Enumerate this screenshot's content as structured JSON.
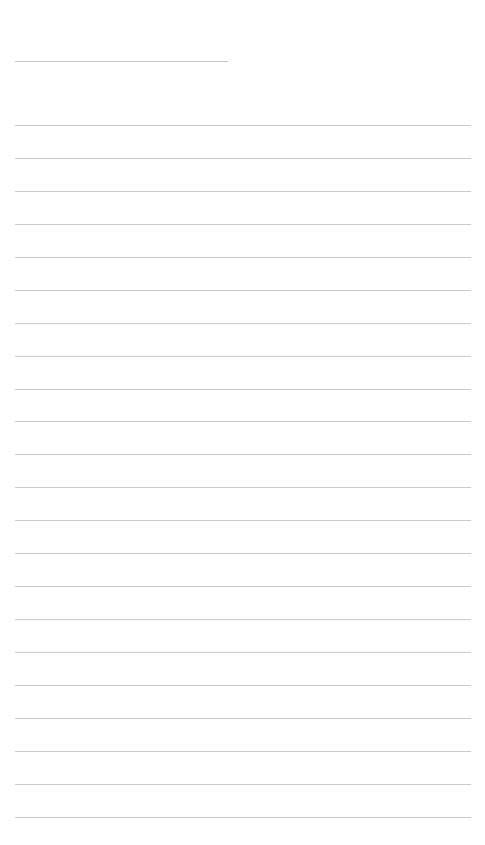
{
  "document": {
    "kind": "ruled-note-page",
    "title_text": "",
    "body_text": "",
    "page_width": 485,
    "page_height": 845,
    "background_color": "#ffffff",
    "rule_color": "#c9cacc",
    "title_rule_color": "#c4c5c7"
  },
  "title_rule": {
    "label": "",
    "x": 15,
    "y": 61,
    "width": 213
  },
  "body_rules": {
    "count": 22,
    "x": 15,
    "width": 456,
    "first_y": 125,
    "spacing": 32.95,
    "lines": [
      {
        "index": 1,
        "y": 125,
        "text": ""
      },
      {
        "index": 2,
        "y": 158,
        "text": ""
      },
      {
        "index": 3,
        "y": 191,
        "text": ""
      },
      {
        "index": 4,
        "y": 224,
        "text": ""
      },
      {
        "index": 5,
        "y": 257,
        "text": ""
      },
      {
        "index": 6,
        "y": 290,
        "text": ""
      },
      {
        "index": 7,
        "y": 323,
        "text": ""
      },
      {
        "index": 8,
        "y": 356,
        "text": ""
      },
      {
        "index": 9,
        "y": 389,
        "text": ""
      },
      {
        "index": 10,
        "y": 421,
        "text": ""
      },
      {
        "index": 11,
        "y": 454,
        "text": ""
      },
      {
        "index": 12,
        "y": 487,
        "text": ""
      },
      {
        "index": 13,
        "y": 520,
        "text": ""
      },
      {
        "index": 14,
        "y": 553,
        "text": ""
      },
      {
        "index": 15,
        "y": 586,
        "text": ""
      },
      {
        "index": 16,
        "y": 619,
        "text": ""
      },
      {
        "index": 17,
        "y": 652,
        "text": ""
      },
      {
        "index": 18,
        "y": 685,
        "text": ""
      },
      {
        "index": 19,
        "y": 718,
        "text": ""
      },
      {
        "index": 20,
        "y": 751,
        "text": ""
      },
      {
        "index": 21,
        "y": 784,
        "text": ""
      },
      {
        "index": 22,
        "y": 817,
        "text": ""
      }
    ]
  }
}
